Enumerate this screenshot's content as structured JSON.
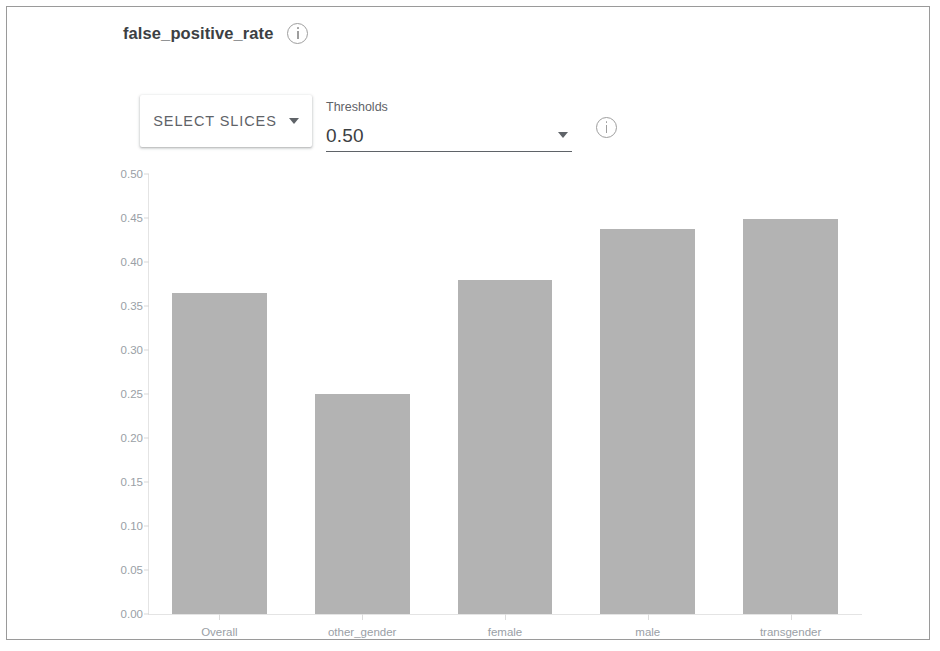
{
  "header": {
    "metric_title": "false_positive_rate",
    "info_icon": "info-icon"
  },
  "controls": {
    "select_slices_label": "SELECT SLICES",
    "select_slices_caret": "chevron-down-icon",
    "thresholds_label": "Thresholds",
    "thresholds_value": "0.50",
    "thresholds_caret": "chevron-down-icon",
    "thresholds_info_icon": "info-icon"
  },
  "colors": {
    "bar_fill": "#b3b3b3",
    "axis": "#e4e4e4",
    "tick_text": "#9aa0a6",
    "title_text": "#3c4043",
    "control_text": "#5f6368",
    "frame_border": "#9a9a9a"
  },
  "chart_data": {
    "type": "bar",
    "title": "false_positive_rate",
    "xlabel": "",
    "ylabel": "",
    "categories": [
      "Overall",
      "other_gender",
      "female",
      "male",
      "transgender"
    ],
    "values": [
      0.365,
      0.25,
      0.38,
      0.438,
      0.449
    ],
    "ylim": [
      0.0,
      0.5
    ],
    "yticks": [
      0.5,
      0.45,
      0.4,
      0.35,
      0.3,
      0.25,
      0.2,
      0.15,
      0.1,
      0.05,
      0.0
    ],
    "ytick_labels": [
      "0.50",
      "0.45",
      "0.40",
      "0.35",
      "0.30",
      "0.25",
      "0.20",
      "0.15",
      "0.10",
      "0.05",
      "0.00"
    ],
    "grid": false,
    "legend": null,
    "series": [
      {
        "name": "false_positive_rate",
        "values": [
          0.365,
          0.25,
          0.38,
          0.438,
          0.449
        ]
      }
    ]
  }
}
